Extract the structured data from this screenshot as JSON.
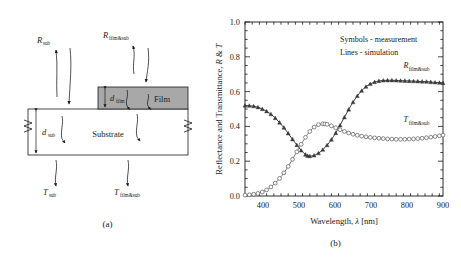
{
  "figure": {
    "panel_a": {
      "caption": "(a)",
      "title": "Optical model schematic of film on substrate",
      "layers": {
        "film_label": "Film",
        "substrate_label": "Substrate"
      },
      "thickness_labels": [
        {
          "base": "d",
          "sub": "film"
        },
        {
          "base": "d",
          "sub": "sub"
        }
      ],
      "ray_labels": [
        {
          "base": "R",
          "sub": "sub"
        },
        {
          "base": "R",
          "sub": "film&sub"
        },
        {
          "base": "T",
          "sub": "sub"
        },
        {
          "base": "T",
          "sub": "film&sub"
        }
      ],
      "colors": {
        "film_fill": "#a8a8a8",
        "substrate_fill": "#ffffff",
        "stroke": "#1a1a1a"
      }
    },
    "panel_b": {
      "caption": "(b)"
    }
  },
  "chart_data": {
    "type": "line",
    "title": "",
    "xlabel": "Wavelength, λ [nm]",
    "ylabel": "Reflectance and Transmittance, R & T",
    "xlabel_parts": {
      "prefix": "Wavelength, ",
      "symbol": "λ",
      "unit": " [nm]"
    },
    "ylabel_parts": {
      "prefix": "Reflectance and Transmittance, ",
      "r": "R",
      "amp": " & ",
      "t": "T"
    },
    "xlim": [
      350,
      900
    ],
    "ylim": [
      0.0,
      1.0
    ],
    "xticks": [
      400,
      500,
      600,
      700,
      800,
      900
    ],
    "xtick_labels": [
      "400",
      "500",
      "600",
      "700",
      "800",
      "900"
    ],
    "yticks": [
      0.0,
      0.2,
      0.4,
      0.6,
      0.8,
      1.0
    ],
    "ytick_labels": [
      "0.0",
      "0.2",
      "0.4",
      "0.6",
      "0.8",
      "1.0"
    ],
    "grid": false,
    "legend_position": "upper-right-annotation",
    "annotations": [
      "Symbols - measurement",
      "Lines - simulation"
    ],
    "series": [
      {
        "name": "R_film&sub",
        "label_base": "R",
        "label_sub": "film&sub",
        "marker": "triangle-filled",
        "marker_color": "#3a3a3a",
        "line_color": "#2b2b2b",
        "label_x": 790,
        "label_y": 0.735,
        "x": [
          350,
          362,
          374,
          386,
          398,
          410,
          422,
          434,
          446,
          458,
          470,
          482,
          494,
          506,
          518,
          524,
          530,
          542,
          554,
          566,
          578,
          590,
          602,
          614,
          626,
          638,
          650,
          662,
          674,
          686,
          698,
          710,
          722,
          734,
          746,
          758,
          770,
          782,
          794,
          806,
          818,
          830,
          842,
          854,
          866,
          878,
          890,
          900
        ],
        "y": [
          0.52,
          0.519,
          0.516,
          0.51,
          0.5,
          0.487,
          0.47,
          0.448,
          0.422,
          0.393,
          0.36,
          0.326,
          0.293,
          0.262,
          0.238,
          0.231,
          0.229,
          0.233,
          0.246,
          0.266,
          0.292,
          0.324,
          0.362,
          0.406,
          0.452,
          0.497,
          0.539,
          0.575,
          0.605,
          0.628,
          0.644,
          0.655,
          0.661,
          0.664,
          0.665,
          0.665,
          0.664,
          0.663,
          0.662,
          0.661,
          0.66,
          0.659,
          0.658,
          0.657,
          0.655,
          0.653,
          0.651,
          0.649
        ]
      },
      {
        "name": "T_film&sub",
        "label_base": "T",
        "label_sub": "film&sub",
        "marker": "circle-open",
        "marker_color": "#6b6b6b",
        "line_color": "#6b6b6b",
        "label_x": 790,
        "label_y": 0.425,
        "x": [
          350,
          362,
          374,
          386,
          398,
          410,
          422,
          434,
          446,
          458,
          470,
          482,
          494,
          506,
          518,
          530,
          542,
          554,
          566,
          572,
          578,
          590,
          602,
          614,
          626,
          638,
          650,
          662,
          674,
          686,
          698,
          710,
          722,
          734,
          746,
          758,
          770,
          782,
          794,
          806,
          818,
          830,
          842,
          854,
          866,
          878,
          890,
          900
        ],
        "y": [
          0.005,
          0.007,
          0.01,
          0.015,
          0.023,
          0.035,
          0.052,
          0.074,
          0.101,
          0.133,
          0.17,
          0.211,
          0.254,
          0.297,
          0.337,
          0.371,
          0.396,
          0.41,
          0.415,
          0.414,
          0.412,
          0.403,
          0.392,
          0.381,
          0.371,
          0.362,
          0.355,
          0.349,
          0.344,
          0.34,
          0.337,
          0.334,
          0.332,
          0.33,
          0.328,
          0.327,
          0.326,
          0.326,
          0.326,
          0.327,
          0.328,
          0.33,
          0.332,
          0.335,
          0.338,
          0.342,
          0.346,
          0.35
        ]
      }
    ]
  }
}
